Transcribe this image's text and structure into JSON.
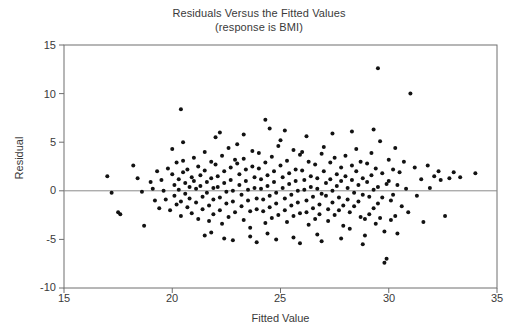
{
  "chart_data": {
    "type": "scatter",
    "title": "Residuals Versus the Fitted Values",
    "subtitle": "(response is BMI)",
    "xlabel": "Fitted Value",
    "ylabel": "Residual",
    "xlim": [
      15,
      35
    ],
    "ylim": [
      -10,
      15
    ],
    "xticks": [
      15,
      20,
      25,
      30,
      35
    ],
    "yticks": [
      15,
      10,
      5,
      0,
      -5,
      -10
    ],
    "grid": false,
    "legend": "none",
    "reference_line": {
      "orientation": "horizontal",
      "y": 0,
      "color": "#8a8a8a"
    },
    "marker": {
      "shape": "circle",
      "color": "#121212",
      "size": 4
    },
    "frame_color": "#6f6f6f",
    "background": "#ffffff",
    "points": [
      [
        17.0,
        1.5
      ],
      [
        17.2,
        -0.2
      ],
      [
        17.5,
        -2.2
      ],
      [
        17.6,
        -2.4
      ],
      [
        18.2,
        2.6
      ],
      [
        18.4,
        1.3
      ],
      [
        18.6,
        -0.1
      ],
      [
        18.7,
        -3.6
      ],
      [
        19.0,
        0.9
      ],
      [
        19.1,
        0.2
      ],
      [
        19.2,
        -1.0
      ],
      [
        19.3,
        2.0
      ],
      [
        19.4,
        -1.8
      ],
      [
        19.5,
        1.1
      ],
      [
        19.6,
        0.0
      ],
      [
        19.7,
        -0.9
      ],
      [
        19.8,
        2.3
      ],
      [
        19.9,
        -2.0
      ],
      [
        20.0,
        4.3
      ],
      [
        20.0,
        1.7
      ],
      [
        20.1,
        0.6
      ],
      [
        20.1,
        -0.5
      ],
      [
        20.2,
        -1.4
      ],
      [
        20.2,
        2.9
      ],
      [
        20.3,
        1.2
      ],
      [
        20.3,
        0.1
      ],
      [
        20.4,
        -1.1
      ],
      [
        20.4,
        -2.6
      ],
      [
        20.5,
        3.1
      ],
      [
        20.5,
        1.9
      ],
      [
        20.6,
        0.8
      ],
      [
        20.6,
        -0.3
      ],
      [
        20.7,
        -1.7
      ],
      [
        20.7,
        2.2
      ],
      [
        20.8,
        0.4
      ],
      [
        20.8,
        -0.8
      ],
      [
        20.9,
        -2.3
      ],
      [
        20.9,
        1.4
      ],
      [
        20.4,
        8.4
      ],
      [
        20.5,
        5.0
      ],
      [
        21.0,
        3.4
      ],
      [
        21.0,
        1.0
      ],
      [
        21.1,
        0.2
      ],
      [
        21.1,
        -1.2
      ],
      [
        21.2,
        -2.9
      ],
      [
        21.2,
        2.5
      ],
      [
        21.3,
        1.6
      ],
      [
        21.3,
        0.5
      ],
      [
        21.4,
        -0.6
      ],
      [
        21.4,
        -1.9
      ],
      [
        21.5,
        4.0
      ],
      [
        21.5,
        2.1
      ],
      [
        21.6,
        0.9
      ],
      [
        21.6,
        -0.2
      ],
      [
        21.7,
        -1.5
      ],
      [
        21.7,
        -3.1
      ],
      [
        21.8,
        3.0
      ],
      [
        21.8,
        1.3
      ],
      [
        21.9,
        0.3
      ],
      [
        21.9,
        -0.9
      ],
      [
        21.9,
        -2.4
      ],
      [
        21.5,
        -4.6
      ],
      [
        21.8,
        -4.3
      ],
      [
        22.0,
        5.5
      ],
      [
        22.0,
        2.7
      ],
      [
        22.1,
        1.5
      ],
      [
        22.1,
        0.4
      ],
      [
        22.2,
        -0.7
      ],
      [
        22.2,
        -2.0
      ],
      [
        22.3,
        -3.4
      ],
      [
        22.3,
        3.6
      ],
      [
        22.4,
        2.0
      ],
      [
        22.4,
        0.8
      ],
      [
        22.5,
        -0.1
      ],
      [
        22.5,
        -1.3
      ],
      [
        22.6,
        -2.7
      ],
      [
        22.6,
        4.4
      ],
      [
        22.7,
        2.4
      ],
      [
        22.7,
        1.1
      ],
      [
        22.8,
        0.0
      ],
      [
        22.8,
        -1.1
      ],
      [
        22.9,
        -2.2
      ],
      [
        22.9,
        3.2
      ],
      [
        22.4,
        -4.9
      ],
      [
        22.8,
        -5.1
      ],
      [
        22.2,
        6.0
      ],
      [
        23.0,
        4.8
      ],
      [
        23.0,
        2.8
      ],
      [
        23.1,
        1.7
      ],
      [
        23.1,
        0.6
      ],
      [
        23.2,
        -0.4
      ],
      [
        23.2,
        -1.6
      ],
      [
        23.3,
        -3.0
      ],
      [
        23.3,
        3.3
      ],
      [
        23.4,
        2.2
      ],
      [
        23.4,
        1.0
      ],
      [
        23.5,
        0.1
      ],
      [
        23.5,
        -1.0
      ],
      [
        23.6,
        -2.1
      ],
      [
        23.6,
        -3.8
      ],
      [
        23.7,
        4.1
      ],
      [
        23.7,
        2.5
      ],
      [
        23.8,
        1.4
      ],
      [
        23.8,
        0.3
      ],
      [
        23.9,
        -0.8
      ],
      [
        23.9,
        -1.9
      ],
      [
        23.3,
        5.8
      ],
      [
        23.6,
        -4.7
      ],
      [
        23.9,
        -5.3
      ],
      [
        24.0,
        3.9
      ],
      [
        24.0,
        2.3
      ],
      [
        24.1,
        1.2
      ],
      [
        24.1,
        0.2
      ],
      [
        24.2,
        -0.9
      ],
      [
        24.2,
        -2.1
      ],
      [
        24.3,
        -3.3
      ],
      [
        24.3,
        2.9
      ],
      [
        24.4,
        1.6
      ],
      [
        24.4,
        0.5
      ],
      [
        24.5,
        -0.5
      ],
      [
        24.5,
        -1.7
      ],
      [
        24.6,
        -2.8
      ],
      [
        24.6,
        3.5
      ],
      [
        24.7,
        2.0
      ],
      [
        24.7,
        0.9
      ],
      [
        24.8,
        -0.2
      ],
      [
        24.8,
        -1.3
      ],
      [
        24.9,
        -2.5
      ],
      [
        24.9,
        4.6
      ],
      [
        24.3,
        7.3
      ],
      [
        24.5,
        6.4
      ],
      [
        24.4,
        -4.4
      ],
      [
        24.8,
        -5.0
      ],
      [
        25.0,
        5.2
      ],
      [
        25.0,
        2.6
      ],
      [
        25.1,
        1.4
      ],
      [
        25.1,
        0.3
      ],
      [
        25.2,
        -0.8
      ],
      [
        25.2,
        -2.0
      ],
      [
        25.3,
        -3.2
      ],
      [
        25.3,
        3.1
      ],
      [
        25.4,
        1.8
      ],
      [
        25.4,
        0.7
      ],
      [
        25.5,
        -0.4
      ],
      [
        25.5,
        -1.5
      ],
      [
        25.6,
        -2.6
      ],
      [
        25.6,
        4.2
      ],
      [
        25.7,
        2.2
      ],
      [
        25.7,
        1.0
      ],
      [
        25.8,
        0.0
      ],
      [
        25.8,
        -1.2
      ],
      [
        25.9,
        -2.3
      ],
      [
        25.9,
        3.7
      ],
      [
        25.2,
        6.2
      ],
      [
        25.6,
        -4.8
      ],
      [
        25.9,
        -5.4
      ],
      [
        26.0,
        4.0
      ],
      [
        26.0,
        2.1
      ],
      [
        26.1,
        1.1
      ],
      [
        26.1,
        0.1
      ],
      [
        26.2,
        -1.0
      ],
      [
        26.2,
        -2.2
      ],
      [
        26.3,
        -3.5
      ],
      [
        26.3,
        3.0
      ],
      [
        26.4,
        1.5
      ],
      [
        26.4,
        0.4
      ],
      [
        26.5,
        -0.6
      ],
      [
        26.5,
        -1.8
      ],
      [
        26.6,
        -2.9
      ],
      [
        26.6,
        2.7
      ],
      [
        26.7,
        1.3
      ],
      [
        26.7,
        0.2
      ],
      [
        26.8,
        -1.4
      ],
      [
        26.8,
        -2.4
      ],
      [
        26.9,
        3.8
      ],
      [
        26.9,
        -0.3
      ],
      [
        26.2,
        5.6
      ],
      [
        26.7,
        -4.5
      ],
      [
        26.9,
        -5.2
      ],
      [
        27.0,
        4.5
      ],
      [
        27.0,
        2.0
      ],
      [
        27.1,
        0.8
      ],
      [
        27.1,
        -0.5
      ],
      [
        27.2,
        -1.9
      ],
      [
        27.2,
        -3.1
      ],
      [
        27.3,
        2.9
      ],
      [
        27.3,
        1.2
      ],
      [
        27.4,
        0.0
      ],
      [
        27.4,
        -1.2
      ],
      [
        27.5,
        -2.5
      ],
      [
        27.5,
        3.4
      ],
      [
        27.6,
        1.7
      ],
      [
        27.6,
        0.5
      ],
      [
        27.7,
        -0.7
      ],
      [
        27.7,
        -2.0
      ],
      [
        27.8,
        2.4
      ],
      [
        27.8,
        1.0
      ],
      [
        27.9,
        -1.5
      ],
      [
        27.9,
        -3.6
      ],
      [
        27.4,
        5.9
      ],
      [
        27.8,
        -4.9
      ],
      [
        28.0,
        3.6
      ],
      [
        28.0,
        1.5
      ],
      [
        28.1,
        0.3
      ],
      [
        28.1,
        -0.9
      ],
      [
        28.2,
        -2.2
      ],
      [
        28.2,
        -3.9
      ],
      [
        28.3,
        2.6
      ],
      [
        28.3,
        1.1
      ],
      [
        28.4,
        -0.2
      ],
      [
        28.4,
        -1.6
      ],
      [
        28.5,
        4.3
      ],
      [
        28.5,
        2.0
      ],
      [
        28.6,
        0.6
      ],
      [
        28.6,
        -1.1
      ],
      [
        28.7,
        -2.7
      ],
      [
        28.7,
        3.0
      ],
      [
        28.8,
        1.3
      ],
      [
        28.8,
        -0.4
      ],
      [
        28.9,
        -2.9
      ],
      [
        28.9,
        -4.6
      ],
      [
        28.3,
        6.1
      ],
      [
        28.8,
        -5.5
      ],
      [
        29.0,
        2.8
      ],
      [
        29.0,
        0.9
      ],
      [
        29.1,
        -0.6
      ],
      [
        29.1,
        -2.4
      ],
      [
        29.2,
        3.9
      ],
      [
        29.2,
        1.6
      ],
      [
        29.3,
        0.1
      ],
      [
        29.3,
        -1.8
      ],
      [
        29.4,
        -3.4
      ],
      [
        29.4,
        2.3
      ],
      [
        29.5,
        0.4
      ],
      [
        29.5,
        -1.3
      ],
      [
        29.6,
        5.1
      ],
      [
        29.6,
        -2.8
      ],
      [
        29.7,
        1.8
      ],
      [
        29.7,
        -0.7
      ],
      [
        29.8,
        -4.2
      ],
      [
        29.8,
        -7.4
      ],
      [
        29.9,
        -7.0
      ],
      [
        29.9,
        0.7
      ],
      [
        29.5,
        12.6
      ],
      [
        29.3,
        6.3
      ],
      [
        30.0,
        3.2
      ],
      [
        30.0,
        1.0
      ],
      [
        30.1,
        -1.0
      ],
      [
        30.1,
        -3.0
      ],
      [
        30.2,
        2.2
      ],
      [
        30.2,
        -0.4
      ],
      [
        30.3,
        -2.6
      ],
      [
        30.3,
        4.4
      ],
      [
        30.4,
        0.6
      ],
      [
        30.4,
        -4.4
      ],
      [
        30.5,
        1.9
      ],
      [
        30.6,
        -1.6
      ],
      [
        30.7,
        3.0
      ],
      [
        30.8,
        0.2
      ],
      [
        30.9,
        -2.2
      ],
      [
        31.0,
        10.0
      ],
      [
        31.2,
        2.4
      ],
      [
        31.3,
        -0.5
      ],
      [
        31.5,
        1.2
      ],
      [
        31.6,
        -3.2
      ],
      [
        31.8,
        2.6
      ],
      [
        31.9,
        0.3
      ],
      [
        32.1,
        1.5
      ],
      [
        32.3,
        2.0
      ],
      [
        32.4,
        1.1
      ],
      [
        32.6,
        -2.6
      ],
      [
        32.8,
        1.3
      ],
      [
        33.0,
        1.9
      ],
      [
        33.3,
        1.4
      ],
      [
        34.0,
        1.8
      ]
    ]
  }
}
